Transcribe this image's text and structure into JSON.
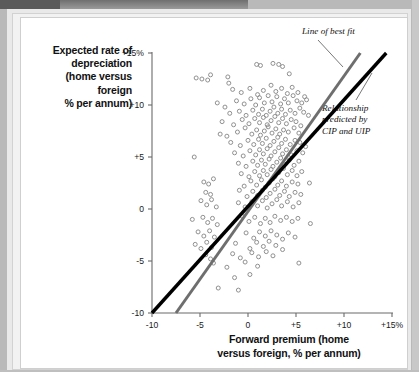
{
  "chart_data": {
    "type": "scatter",
    "title": "",
    "xlabel": "Forward premium (home versus foreign, % per annum)",
    "ylabel": "Expected rate of depreciation (home versus foreign % per annum)",
    "xlim": [
      -10,
      15
    ],
    "ylim": [
      -10,
      15
    ],
    "xticks": [
      "-10",
      "-5",
      "0",
      "+5",
      "+10",
      "+15%"
    ],
    "xtick_values": [
      -10,
      -5,
      0,
      5,
      10,
      15
    ],
    "yticks": [
      "+15%",
      "+10",
      "+5",
      "0",
      "-5",
      "-10"
    ],
    "ytick_values": [
      15,
      10,
      5,
      0,
      -5,
      -10
    ],
    "grid": false,
    "legend": "none",
    "marker": "open-circle",
    "marker_color": "#8a8a8a",
    "series": [
      {
        "name": "Observations",
        "points": [
          [
            -5.4,
            12.6
          ],
          [
            -4.8,
            12.5
          ],
          [
            -4.2,
            12.4
          ],
          [
            -3.9,
            12.9
          ],
          [
            -2.1,
            12.7
          ],
          [
            -2.0,
            12.1
          ],
          [
            0.9,
            13.9
          ],
          [
            1.3,
            13.8
          ],
          [
            2.6,
            14.0
          ],
          [
            3.2,
            13.9
          ],
          [
            3.6,
            13.7
          ],
          [
            4.3,
            13.0
          ],
          [
            -1.6,
            11.5
          ],
          [
            -0.7,
            11.2
          ],
          [
            0.2,
            11.6
          ],
          [
            1.0,
            11.0
          ],
          [
            1.6,
            11.4
          ],
          [
            2.4,
            11.9
          ],
          [
            2.9,
            11.3
          ],
          [
            3.5,
            11.6
          ],
          [
            4.1,
            11.1
          ],
          [
            4.6,
            11.7
          ],
          [
            5.2,
            11.2
          ],
          [
            5.9,
            10.8
          ],
          [
            -3.2,
            10.2
          ],
          [
            -2.4,
            9.8
          ],
          [
            -1.2,
            10.4
          ],
          [
            -0.4,
            10.1
          ],
          [
            0.3,
            10.6
          ],
          [
            0.8,
            10.0
          ],
          [
            1.2,
            10.7
          ],
          [
            1.7,
            10.2
          ],
          [
            2.1,
            10.9
          ],
          [
            2.5,
            10.3
          ],
          [
            3.0,
            10.8
          ],
          [
            3.4,
            10.1
          ],
          [
            3.8,
            10.6
          ],
          [
            4.2,
            10.2
          ],
          [
            4.7,
            10.9
          ],
          [
            5.1,
            10.4
          ],
          [
            5.6,
            10.2
          ],
          [
            6.1,
            10.5
          ],
          [
            -1.9,
            9.2
          ],
          [
            -0.9,
            9.4
          ],
          [
            -0.2,
            9.0
          ],
          [
            0.5,
            9.5
          ],
          [
            1.1,
            9.1
          ],
          [
            1.5,
            9.6
          ],
          [
            1.9,
            9.0
          ],
          [
            2.3,
            9.4
          ],
          [
            2.7,
            9.8
          ],
          [
            3.1,
            9.2
          ],
          [
            3.5,
            9.6
          ],
          [
            3.9,
            9.1
          ],
          [
            4.4,
            9.5
          ],
          [
            4.9,
            9.2
          ],
          [
            5.4,
            9.7
          ],
          [
            5.8,
            9.3
          ],
          [
            6.3,
            9.0
          ],
          [
            -2.7,
            8.4
          ],
          [
            -1.5,
            8.1
          ],
          [
            -0.6,
            8.6
          ],
          [
            0.1,
            8.2
          ],
          [
            0.7,
            8.7
          ],
          [
            1.2,
            8.3
          ],
          [
            1.6,
            8.8
          ],
          [
            2.0,
            8.1
          ],
          [
            2.4,
            8.5
          ],
          [
            2.8,
            8.9
          ],
          [
            3.2,
            8.3
          ],
          [
            3.6,
            8.7
          ],
          [
            4.0,
            8.2
          ],
          [
            4.5,
            8.6
          ],
          [
            5.0,
            8.4
          ],
          [
            5.5,
            8.0
          ],
          [
            -1.1,
            7.4
          ],
          [
            -0.3,
            7.8
          ],
          [
            0.4,
            7.2
          ],
          [
            0.9,
            7.6
          ],
          [
            1.3,
            7.1
          ],
          [
            1.7,
            7.5
          ],
          [
            2.1,
            7.9
          ],
          [
            2.5,
            7.3
          ],
          [
            2.9,
            7.7
          ],
          [
            3.3,
            7.2
          ],
          [
            3.7,
            7.6
          ],
          [
            4.2,
            7.4
          ],
          [
            4.8,
            7.8
          ],
          [
            5.3,
            7.3
          ],
          [
            -2.2,
            7.0
          ],
          [
            -2.9,
            7.2
          ],
          [
            -1.8,
            6.4
          ],
          [
            -0.8,
            6.1
          ],
          [
            0.0,
            6.6
          ],
          [
            0.6,
            6.2
          ],
          [
            1.1,
            6.7
          ],
          [
            1.5,
            6.3
          ],
          [
            1.9,
            6.8
          ],
          [
            2.3,
            6.1
          ],
          [
            2.7,
            6.5
          ],
          [
            3.1,
            6.9
          ],
          [
            3.5,
            6.3
          ],
          [
            3.9,
            6.7
          ],
          [
            4.4,
            6.2
          ],
          [
            4.9,
            6.6
          ],
          [
            5.4,
            6.4
          ],
          [
            6.0,
            6.0
          ],
          [
            -5.6,
            5.0
          ],
          [
            -1.4,
            5.4
          ],
          [
            -0.5,
            5.1
          ],
          [
            0.2,
            5.6
          ],
          [
            0.8,
            5.2
          ],
          [
            1.2,
            5.7
          ],
          [
            1.6,
            5.3
          ],
          [
            2.0,
            5.8
          ],
          [
            2.4,
            5.1
          ],
          [
            2.8,
            5.5
          ],
          [
            3.2,
            5.9
          ],
          [
            3.6,
            5.3
          ],
          [
            4.0,
            5.7
          ],
          [
            4.5,
            5.2
          ],
          [
            5.1,
            5.6
          ],
          [
            5.7,
            5.4
          ],
          [
            -1.0,
            4.4
          ],
          [
            -0.2,
            4.1
          ],
          [
            0.5,
            4.6
          ],
          [
            1.0,
            4.2
          ],
          [
            1.4,
            4.7
          ],
          [
            1.8,
            4.3
          ],
          [
            2.2,
            4.8
          ],
          [
            2.6,
            4.1
          ],
          [
            3.0,
            4.5
          ],
          [
            3.4,
            4.9
          ],
          [
            3.8,
            4.3
          ],
          [
            4.3,
            4.7
          ],
          [
            4.8,
            4.2
          ],
          [
            5.3,
            4.6
          ],
          [
            -0.7,
            3.4
          ],
          [
            0.1,
            3.1
          ],
          [
            0.7,
            3.6
          ],
          [
            1.2,
            3.2
          ],
          [
            1.6,
            3.7
          ],
          [
            2.0,
            3.3
          ],
          [
            2.4,
            3.8
          ],
          [
            2.8,
            3.1
          ],
          [
            3.2,
            3.5
          ],
          [
            3.7,
            3.9
          ],
          [
            4.1,
            3.3
          ],
          [
            4.6,
            3.7
          ],
          [
            5.1,
            3.2
          ],
          [
            5.6,
            3.6
          ],
          [
            -4.6,
            2.6
          ],
          [
            -4.1,
            2.4
          ],
          [
            -3.6,
            2.9
          ],
          [
            -0.4,
            2.2
          ],
          [
            0.3,
            2.7
          ],
          [
            0.9,
            2.3
          ],
          [
            1.4,
            2.8
          ],
          [
            1.8,
            2.1
          ],
          [
            2.2,
            2.5
          ],
          [
            2.6,
            2.9
          ],
          [
            3.1,
            2.3
          ],
          [
            3.5,
            2.7
          ],
          [
            4.0,
            2.2
          ],
          [
            4.6,
            2.6
          ],
          [
            5.2,
            2.4
          ],
          [
            6.4,
            2.5
          ],
          [
            -4.4,
            1.6
          ],
          [
            -3.9,
            1.4
          ],
          [
            -0.9,
            1.8
          ],
          [
            -0.1,
            1.2
          ],
          [
            0.5,
            1.7
          ],
          [
            1.0,
            1.3
          ],
          [
            1.5,
            1.8
          ],
          [
            1.9,
            1.1
          ],
          [
            2.3,
            1.5
          ],
          [
            2.8,
            1.9
          ],
          [
            3.3,
            1.3
          ],
          [
            3.8,
            1.7
          ],
          [
            4.3,
            1.2
          ],
          [
            4.9,
            1.6
          ],
          [
            5.5,
            1.4
          ],
          [
            -4.9,
            0.8
          ],
          [
            -4.3,
            0.4
          ],
          [
            -3.8,
            0.9
          ],
          [
            -3.3,
            0.2
          ],
          [
            -1.0,
            0.6
          ],
          [
            -0.3,
            0.2
          ],
          [
            0.4,
            0.7
          ],
          [
            1.0,
            0.3
          ],
          [
            1.5,
            0.8
          ],
          [
            2.0,
            0.1
          ],
          [
            2.5,
            0.5
          ],
          [
            3.0,
            0.9
          ],
          [
            3.5,
            0.3
          ],
          [
            4.1,
            0.7
          ],
          [
            4.7,
            0.2
          ],
          [
            5.3,
            0.6
          ],
          [
            -5.8,
            -1.0
          ],
          [
            -4.7,
            -0.8
          ],
          [
            -4.2,
            -1.3
          ],
          [
            -3.7,
            -0.9
          ],
          [
            -3.2,
            -1.5
          ],
          [
            -0.6,
            -0.7
          ],
          [
            0.1,
            -1.2
          ],
          [
            0.7,
            -0.8
          ],
          [
            1.3,
            -1.4
          ],
          [
            1.8,
            -0.9
          ],
          [
            2.3,
            -1.3
          ],
          [
            2.8,
            -0.7
          ],
          [
            3.4,
            -1.1
          ],
          [
            4.0,
            -0.8
          ],
          [
            4.6,
            -1.2
          ],
          [
            5.2,
            -0.9
          ],
          [
            6.5,
            -1.4
          ],
          [
            -5.2,
            -2.2
          ],
          [
            -4.6,
            -2.6
          ],
          [
            -4.0,
            -2.1
          ],
          [
            -3.5,
            -2.7
          ],
          [
            -0.2,
            -2.3
          ],
          [
            0.6,
            -2.8
          ],
          [
            1.2,
            -2.2
          ],
          [
            1.8,
            -2.6
          ],
          [
            2.4,
            -2.1
          ],
          [
            3.0,
            -2.5
          ],
          [
            3.6,
            -2.9
          ],
          [
            4.2,
            -2.3
          ],
          [
            4.9,
            -2.7
          ],
          [
            -5.5,
            -3.4
          ],
          [
            -4.9,
            -3.8
          ],
          [
            -4.3,
            -3.2
          ],
          [
            -3.8,
            -3.7
          ],
          [
            -1.3,
            -3.3
          ],
          [
            0.2,
            -3.8
          ],
          [
            0.9,
            -3.2
          ],
          [
            1.6,
            -3.6
          ],
          [
            2.2,
            -3.1
          ],
          [
            2.9,
            -3.5
          ],
          [
            3.6,
            -3.9
          ],
          [
            -4.4,
            -4.4
          ],
          [
            -3.9,
            -4.8
          ],
          [
            -1.6,
            -4.3
          ],
          [
            -0.8,
            -4.7
          ],
          [
            0.4,
            -4.2
          ],
          [
            1.1,
            -4.6
          ],
          [
            1.9,
            -4.1
          ],
          [
            2.6,
            -4.5
          ],
          [
            -3.6,
            -5.2
          ],
          [
            -2.2,
            -5.6
          ],
          [
            -0.3,
            -5.1
          ],
          [
            1.0,
            -5.5
          ],
          [
            5.3,
            -5.2
          ],
          [
            -1.4,
            -6.6
          ],
          [
            0.2,
            -6.3
          ],
          [
            -1.0,
            -7.8
          ],
          [
            -3.1,
            -7.6
          ]
        ]
      }
    ],
    "lines": [
      {
        "name": "Line of best fit",
        "color": "#6e6e6e",
        "width": 3,
        "from": [
          -7.5,
          -10
        ],
        "to": [
          11.7,
          15
        ]
      },
      {
        "name": "Relationship predicted by CIP and UIP",
        "color": "#000000",
        "width": 3.4,
        "from": [
          -10,
          -10
        ],
        "to": [
          14.4,
          15
        ]
      }
    ],
    "annotations": [
      {
        "name": "line-of-best-fit-annotation",
        "text": "Line of best fit",
        "style": "italic"
      },
      {
        "name": "cip-uip-annotation",
        "line1": "Relationship",
        "line2": "predicted by",
        "line3": "CIP and UIP",
        "style": "italic"
      }
    ]
  },
  "axis": {
    "ylabel_lines": [
      "Expected rate of",
      "depreciation",
      "(home versus",
      "foreign",
      "% per annum)"
    ],
    "xlabel_lines": [
      "Forward premium (home",
      "versus foreign, % per annum)"
    ]
  },
  "colors": {
    "best_fit_line": "#6e6e6e",
    "cip_uip_line": "#000000",
    "marker": "#8a8a8a",
    "axis": "#6b6b6b",
    "text": "#111111",
    "page": "#ffffff"
  }
}
